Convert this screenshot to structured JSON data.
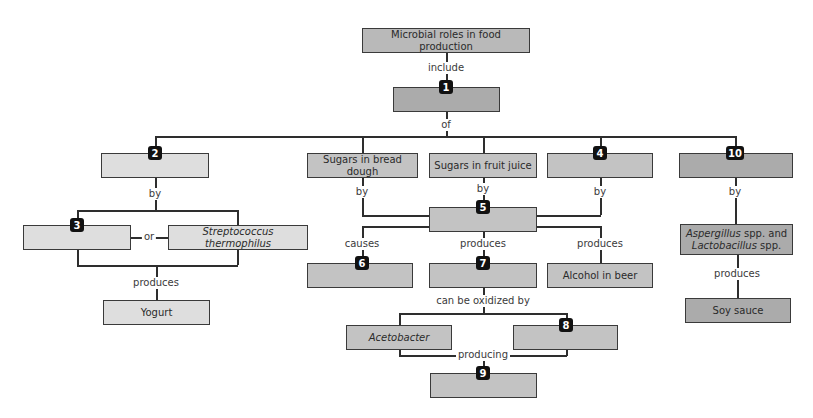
{
  "diagram": {
    "title_box": "Microbial roles in food production",
    "links": {
      "include": "include",
      "of": "of",
      "by_2": "by",
      "or": "or",
      "produces_yogurt": "produces",
      "by_bread": "by",
      "by_fruit": "by",
      "by_4": "by",
      "by_10": "by",
      "causes": "causes",
      "produces_7": "produces",
      "produces_alcohol": "produces",
      "produces_soy": "produces",
      "oxidized": "can be oxidized by",
      "producing": "producing"
    },
    "nodes": {
      "box1": {
        "badge": "1",
        "text": ""
      },
      "box2": {
        "badge": "2",
        "text": ""
      },
      "box3": {
        "badge": "3",
        "text": ""
      },
      "strep": {
        "text": "Streptococcus thermophilus"
      },
      "yogurt": {
        "text": "Yogurt"
      },
      "bread": {
        "text": "Sugars in bread dough"
      },
      "fruit": {
        "text": "Sugars in fruit juice"
      },
      "box4": {
        "badge": "4",
        "text": ""
      },
      "box10": {
        "badge": "10",
        "text": ""
      },
      "box5": {
        "badge": "5",
        "text": ""
      },
      "box6": {
        "badge": "6",
        "text": ""
      },
      "box7": {
        "badge": "7",
        "text": ""
      },
      "alcohol": {
        "text": "Alcohol in beer"
      },
      "asp_italic": "Aspergillus",
      "asp_rest": " spp. and",
      "lac_italic": "Lactobacillus",
      "lac_rest": " spp.",
      "soy": {
        "text": "Soy sauce"
      },
      "acetobacter": {
        "text": "Acetobacter"
      },
      "box8": {
        "badge": "8",
        "text": ""
      },
      "box9": {
        "badge": "9",
        "text": ""
      }
    }
  }
}
